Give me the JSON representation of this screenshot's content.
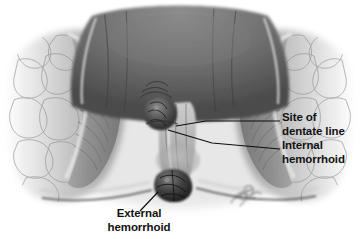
{
  "figure": {
    "type": "medical-anatomical-illustration",
    "style": "grayscale airbrush medical illustration on white background",
    "background_color": "#ffffff",
    "text_color": "#121212"
  },
  "labels": {
    "dentate_line": {
      "line1": "Site of",
      "line2": "dentate line"
    },
    "internal_hemorrhoid": {
      "line1": "Internal",
      "line2": "hemorrhoid"
    },
    "external_hemorrhoid": {
      "line1": "External",
      "line2": "hemorrhoid"
    }
  },
  "signature": {
    "present": true,
    "description": "faint cursive artist signature"
  },
  "anatomy": {
    "regions": [
      "rectal lumen",
      "anal canal",
      "left gluteal tissue",
      "right gluteal tissue",
      "internal hemorrhoid mass",
      "external hemorrhoid mass"
    ]
  }
}
